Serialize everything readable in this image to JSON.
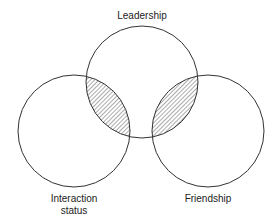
{
  "diagram": {
    "type": "venn",
    "sets": [
      {
        "id": "leadership",
        "label": "Leadership",
        "cx": 142,
        "cy": 82,
        "r": 56
      },
      {
        "id": "interaction",
        "label": "Interaction status",
        "label_lines": [
          "Interaction",
          "status"
        ],
        "cx": 74,
        "cy": 131,
        "r": 56
      },
      {
        "id": "friendship",
        "label": "Friendship",
        "cx": 208,
        "cy": 131,
        "r": 56
      }
    ],
    "shaded_regions": [
      {
        "intersection": [
          "leadership",
          "interaction"
        ],
        "fill": "hatched"
      },
      {
        "intersection": [
          "leadership",
          "friendship"
        ],
        "fill": "hatched"
      }
    ],
    "colors": {
      "stroke": "#333333",
      "hatch": "#444444",
      "background": "#ffffff"
    }
  }
}
